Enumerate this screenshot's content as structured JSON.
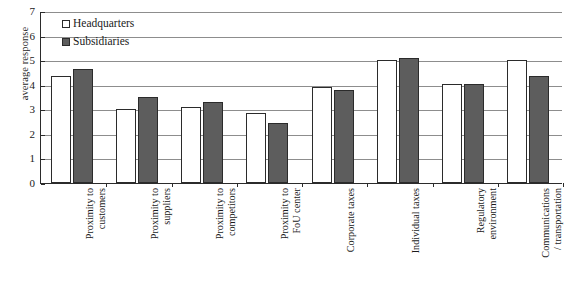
{
  "chart_data": {
    "type": "bar",
    "title": "",
    "xlabel": "",
    "ylabel": "average response",
    "ylim": [
      0,
      7
    ],
    "yticks": [
      0,
      1,
      2,
      3,
      4,
      5,
      6,
      7
    ],
    "grid": true,
    "legend_position": "top-left",
    "categories": [
      "Proximity to\ncustomers",
      "Proximity to\nsuppliers",
      "Proximity to\ncompetitors",
      "Proximity to\nFoU center",
      "Corporate taxes",
      "Individual taxes",
      "Regulatory\nenvironment",
      "Communications\n/ transportation"
    ],
    "series": [
      {
        "name": "Headquarters",
        "color": "#ffffff",
        "values": [
          4.35,
          3.0,
          3.1,
          2.85,
          3.9,
          5.0,
          4.05,
          5.0
        ]
      },
      {
        "name": "Subsidiaries",
        "color": "#5d5d5d",
        "values": [
          4.65,
          3.5,
          3.3,
          2.45,
          3.8,
          5.1,
          4.05,
          4.35
        ]
      }
    ]
  },
  "axis": {
    "y_title": "average response",
    "y_tick_labels": [
      "0",
      "1",
      "2",
      "3",
      "4",
      "5",
      "6",
      "7"
    ]
  },
  "legend": {
    "items": [
      {
        "label": "Headquarters",
        "swatch": "headquarters-swatch"
      },
      {
        "label": "Subsidiaries",
        "swatch": "subsidiaries-swatch"
      }
    ]
  }
}
